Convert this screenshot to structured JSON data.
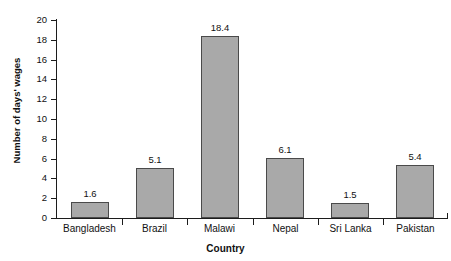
{
  "chart_data": {
    "type": "bar",
    "title": "Cost of Treatment in Low- and Middle-Income Countries",
    "xlabel": "Country",
    "ylabel": "Number of days' wages",
    "categories": [
      "Bangladesh",
      "Brazil",
      "Malawi",
      "Nepal",
      "Sri Lanka",
      "Pakistan"
    ],
    "values": [
      1.6,
      5.1,
      18.4,
      6.1,
      1.5,
      5.4
    ],
    "value_labels": [
      "1.6",
      "5.1",
      "18.4",
      "6.1",
      "1.5",
      "5.4"
    ],
    "ylim": [
      0,
      20
    ],
    "ytick_values": [
      0,
      2,
      4,
      6,
      8,
      10,
      12,
      14,
      16,
      18,
      20
    ],
    "ytick_labels": [
      "0",
      "2",
      "4",
      "6",
      "8",
      "10",
      "12",
      "14",
      "16",
      "18",
      "20"
    ],
    "grid": false,
    "legend": false,
    "bar_color": "#a9a9a9",
    "bar_border_color": "#4a4a4a",
    "axis_color": "#1c1c1c",
    "text_color": "#111111"
  }
}
